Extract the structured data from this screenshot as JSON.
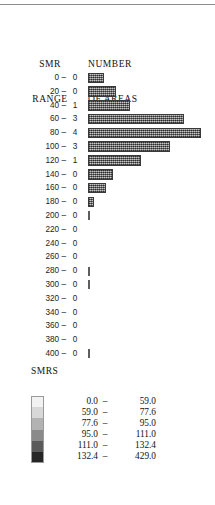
{
  "header": {
    "smr_range_line1": "SMR",
    "smr_range_line2": "RANGE",
    "number_line1": "NUMBER",
    "number_line2": "OF AREAS"
  },
  "chart_data": {
    "type": "bar",
    "orientation": "horizontal",
    "title": "",
    "xlabel": "NUMBER OF AREAS",
    "ylabel": "SMR RANGE",
    "grid": false,
    "legend_position": "below",
    "categories": [
      "0 –",
      "20 –",
      "40 –",
      "60 –",
      "80 –",
      "100 –",
      "120 –",
      "140 –",
      "160 –",
      "180 –",
      "200 –",
      "220 –",
      "240 –",
      "260 –",
      "280 –",
      "300 –",
      "320 –",
      "340 –",
      "360 –",
      "380 –",
      "400 –"
    ],
    "count_labels": [
      "0",
      "0",
      "1",
      "3",
      "4",
      "3",
      "1",
      "0",
      "0",
      "0",
      "0",
      "0",
      "0",
      "0",
      "0",
      "0",
      "0",
      "0",
      "0",
      "0",
      "0"
    ],
    "values": [
      14,
      25,
      37,
      85,
      100,
      73,
      47,
      22,
      16,
      5,
      1,
      0,
      0,
      0,
      1,
      1,
      0,
      0,
      0,
      0,
      1
    ],
    "xlim": [
      0,
      110
    ],
    "rows": [
      {
        "range": "0 –",
        "count": "0",
        "bar": 14,
        "style": "bar"
      },
      {
        "range": "20 –",
        "count": "0",
        "bar": 25,
        "style": "bar"
      },
      {
        "range": "40 –",
        "count": "1",
        "bar": 37,
        "style": "bar"
      },
      {
        "range": "60 –",
        "count": "3",
        "bar": 85,
        "style": "bar"
      },
      {
        "range": "80 –",
        "count": "4",
        "bar": 100,
        "style": "bar"
      },
      {
        "range": "100 –",
        "count": "3",
        "bar": 73,
        "style": "bar"
      },
      {
        "range": "120 –",
        "count": "1",
        "bar": 47,
        "style": "bar"
      },
      {
        "range": "140 –",
        "count": "0",
        "bar": 22,
        "style": "bar"
      },
      {
        "range": "160 –",
        "count": "0",
        "bar": 16,
        "style": "bar"
      },
      {
        "range": "180 –",
        "count": "0",
        "bar": 5,
        "style": "bar"
      },
      {
        "range": "200 –",
        "count": "0",
        "bar": 1,
        "style": "tick"
      },
      {
        "range": "220 –",
        "count": "0",
        "bar": 0,
        "style": "empty"
      },
      {
        "range": "240 –",
        "count": "0",
        "bar": 0,
        "style": "empty"
      },
      {
        "range": "260 –",
        "count": "0",
        "bar": 0,
        "style": "empty"
      },
      {
        "range": "280 –",
        "count": "0",
        "bar": 1,
        "style": "tick"
      },
      {
        "range": "300 –",
        "count": "0",
        "bar": 1,
        "style": "tick"
      },
      {
        "range": "320 –",
        "count": "0",
        "bar": 0,
        "style": "empty"
      },
      {
        "range": "340 –",
        "count": "0",
        "bar": 0,
        "style": "empty"
      },
      {
        "range": "360 –",
        "count": "0",
        "bar": 0,
        "style": "empty"
      },
      {
        "range": "380 –",
        "count": "0",
        "bar": 0,
        "style": "empty"
      },
      {
        "range": "400 –",
        "count": "0",
        "bar": 1,
        "style": "tick"
      }
    ]
  },
  "legend": {
    "title": "SMRS",
    "classes": [
      {
        "low": "0.0",
        "dash": "–",
        "high": "59.0",
        "color": "#f2f2f2"
      },
      {
        "low": "59.0",
        "dash": "–",
        "high": "77.6",
        "color": "#d8d8d8"
      },
      {
        "low": "77.6",
        "dash": "–",
        "high": "95.0",
        "color": "#b3b3b3"
      },
      {
        "low": "95.0",
        "dash": "–",
        "high": "111.0",
        "color": "#8a8a8a"
      },
      {
        "low": "111.0",
        "dash": "–",
        "high": "132.4",
        "color": "#5a5a5a"
      },
      {
        "low": "132.4",
        "dash": "–",
        "high": "429.0",
        "color": "#262626"
      }
    ]
  }
}
